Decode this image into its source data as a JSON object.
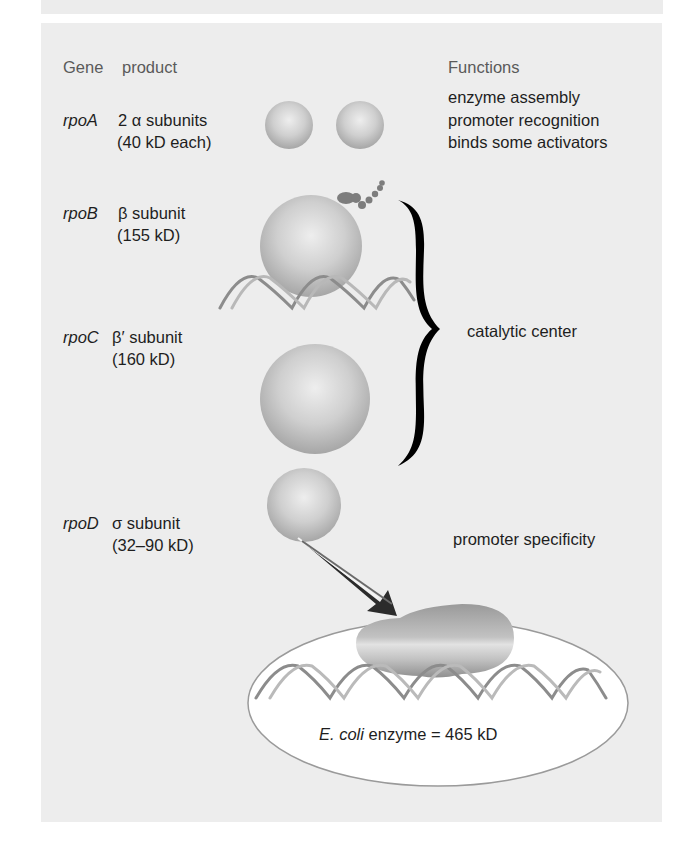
{
  "headers": {
    "gene": "Gene",
    "product": "product",
    "functions": "Functions"
  },
  "rows": [
    {
      "gene": "rpoA",
      "product_line1": "2 α subunits",
      "product_line2": "(40 kD  each)",
      "functions": [
        "enzyme assembly",
        "promoter recognition",
        "binds some activators"
      ]
    },
    {
      "gene": "rpoB",
      "product_line1": "β subunit",
      "product_line2": "(155 kD)"
    },
    {
      "gene": "rpoC",
      "product_line1": "β′ subunit",
      "product_line2": "(160 kD)"
    },
    {
      "gene": "rpoD",
      "product_line1": "σ subunit",
      "product_line2": "(32–90 kD)",
      "functions": [
        "promoter specificity"
      ]
    }
  ],
  "brace_label": "catalytic center",
  "holoenzyme": {
    "organism": "E. coli",
    "label_rest": "enzyme  = 465 kD"
  },
  "colors": {
    "panel": "#ededed",
    "sphere_light": "#e2e2e2",
    "sphere_dark": "#a8a8a8",
    "brace": "#000000",
    "ellipse_fill": "#ffffff",
    "ellipse_stroke": "#9a9a9a"
  }
}
